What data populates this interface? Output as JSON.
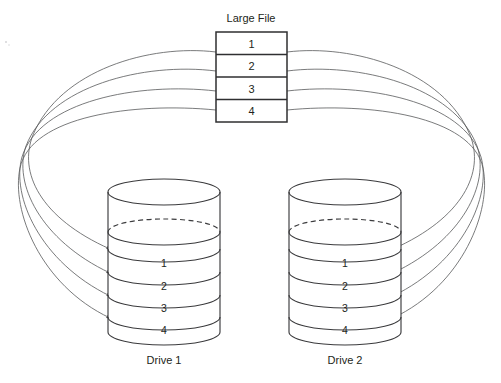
{
  "diagram": {
    "title_label": "Large File",
    "kind": "raid-mirroring",
    "colors": {
      "line": "#3b3b3d",
      "thin_line": "#58595b",
      "box_stroke": "#2f2f31",
      "text": "#231f20",
      "background": "#ffffff"
    }
  },
  "large_file": {
    "label": "Large File",
    "blocks": [
      {
        "label": "1"
      },
      {
        "label": "2"
      },
      {
        "label": "3"
      },
      {
        "label": "4"
      }
    ]
  },
  "drives": [
    {
      "name": "drive-1",
      "label": "Drive 1",
      "bands": [
        {
          "label": "1"
        },
        {
          "label": "2"
        },
        {
          "label": "3"
        },
        {
          "label": "4"
        }
      ]
    },
    {
      "name": "drive-2",
      "label": "Drive 2",
      "bands": [
        {
          "label": "1"
        },
        {
          "label": "2"
        },
        {
          "label": "3"
        },
        {
          "label": "4"
        }
      ]
    }
  ],
  "connectors": {
    "left_arrow_count": 4,
    "right_arrow_count": 4,
    "description": "Each file block routes to both drives"
  }
}
